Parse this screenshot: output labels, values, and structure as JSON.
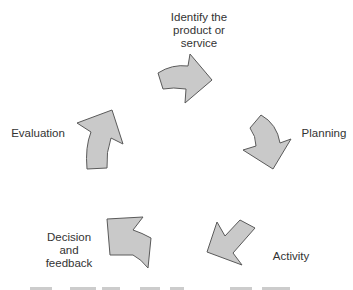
{
  "diagram": {
    "type": "cycle",
    "colors": {
      "arrow_fill": "#c9c9c9",
      "arrow_stroke": "#5a5a5a",
      "text": "#333333",
      "background": "#ffffff"
    },
    "stages": [
      {
        "id": "identify",
        "lines": [
          "Identify the",
          "product or",
          "service"
        ]
      },
      {
        "id": "planning",
        "lines": [
          "Planning"
        ]
      },
      {
        "id": "activity",
        "lines": [
          "Activity"
        ]
      },
      {
        "id": "decision",
        "lines": [
          "Decision",
          "and",
          "feedback"
        ]
      },
      {
        "id": "evaluation",
        "lines": [
          "Evaluation"
        ]
      }
    ],
    "arrows": [
      {
        "from": "identify",
        "to": "planning",
        "direction": "right"
      },
      {
        "from": "planning",
        "to": "activity",
        "direction": "down"
      },
      {
        "from": "activity",
        "to": "decision",
        "direction": "down-left"
      },
      {
        "from": "decision",
        "to": "evaluation",
        "direction": "up-left"
      },
      {
        "from": "evaluation",
        "to": "identify",
        "direction": "up"
      }
    ]
  }
}
